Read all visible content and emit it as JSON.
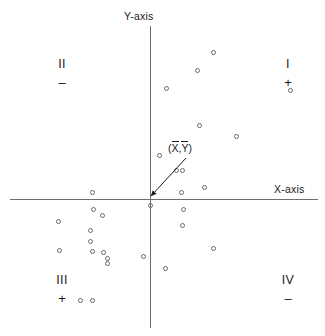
{
  "figure": {
    "width": 325,
    "height": 336,
    "background": "#ffffff",
    "ink_color": "#1a1a1a",
    "axis_color": "#6e6e6e",
    "marker_color": "#6a6a6a"
  },
  "axes": {
    "x_label": "X-axis",
    "y_label": "Y-axis",
    "origin_x": 150,
    "origin_y": 199,
    "x_start": 10,
    "x_end": 318,
    "y_start": 26,
    "y_end": 328
  },
  "quadrants": [
    {
      "name": "quadrant-one",
      "roman": "I",
      "sign": "+",
      "x": 288,
      "y": 58
    },
    {
      "name": "quadrant-two",
      "roman": "II",
      "sign": "–",
      "x": 62,
      "y": 58
    },
    {
      "name": "quadrant-three",
      "roman": "III",
      "sign": "+",
      "x": 62,
      "y": 274
    },
    {
      "name": "quadrant-four",
      "roman": "IV",
      "sign": "–",
      "x": 288,
      "y": 274
    }
  ],
  "centroid": {
    "label_open": "(",
    "label_x": "X",
    "label_sep": ",",
    "label_y": "Y",
    "label_close": ")",
    "label_px": 168,
    "label_py": 142,
    "arrow_tail_x": 186,
    "arrow_tail_y": 158,
    "arrow_head_x": 151,
    "arrow_head_y": 196
  },
  "chart_data": {
    "type": "scatter",
    "title": "",
    "xlabel": "X-axis",
    "ylabel": "Y-axis",
    "grid": false,
    "legend": null,
    "annotations": [
      {
        "text": "(X̄,Ȳ)",
        "points_to": "origin",
        "meaning": "centroid of the data, mean of X and mean of Y"
      },
      {
        "text": "I",
        "sign": "+",
        "meaning": "quadrant I product of deviations positive"
      },
      {
        "text": "II",
        "sign": "–",
        "meaning": "quadrant II product of deviations negative"
      },
      {
        "text": "III",
        "sign": "+",
        "meaning": "quadrant III product of deviations positive"
      },
      {
        "text": "IV",
        "sign": "–",
        "meaning": "quadrant IV product of deviations negative"
      }
    ],
    "origin_px": [
      150,
      199
    ],
    "points_px": [
      [
        213,
        52
      ],
      [
        197,
        70
      ],
      [
        166,
        88
      ],
      [
        290,
        90
      ],
      [
        199,
        125
      ],
      [
        236,
        136
      ],
      [
        159,
        155
      ],
      [
        176,
        170
      ],
      [
        182,
        170
      ],
      [
        204,
        187
      ],
      [
        181,
        192
      ],
      [
        150,
        205
      ],
      [
        92,
        192
      ],
      [
        183,
        209
      ],
      [
        182,
        225
      ],
      [
        58,
        221
      ],
      [
        213,
        248
      ],
      [
        93,
        209
      ],
      [
        102,
        215
      ],
      [
        90,
        230
      ],
      [
        90,
        241
      ],
      [
        59,
        250
      ],
      [
        92,
        251
      ],
      [
        103,
        252
      ],
      [
        107,
        258
      ],
      [
        107,
        263
      ],
      [
        143,
        256
      ],
      [
        165,
        268
      ],
      [
        80,
        300
      ],
      [
        92,
        300
      ]
    ],
    "points_count": 30
  }
}
